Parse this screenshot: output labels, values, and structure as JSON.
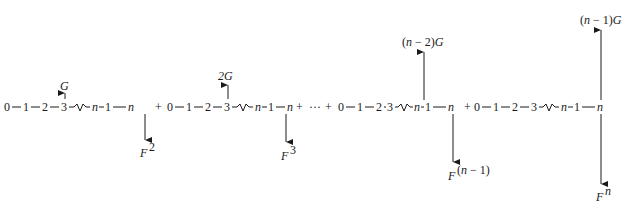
{
  "diagram": {
    "type": "sum of chain graphs with vertex loadings",
    "baseline_y": 107,
    "groups": [
      {
        "nodes": [
          "0",
          "1",
          "2",
          "3",
          "n",
          "n",
          "1",
          "n"
        ],
        "up_label": "G",
        "down_label": "F²",
        "operator_after": "+"
      },
      {
        "nodes": [
          "0",
          "1",
          "2",
          "3",
          "n",
          "1",
          "n"
        ],
        "up_label": "2G",
        "down_label": "F³",
        "operator_after": "+ ··· +"
      },
      {
        "nodes": [
          "0",
          "1",
          "2",
          "3",
          "n",
          "1",
          "n"
        ],
        "up_label": "(n − 2)G",
        "down_label": "F(n − 1)",
        "operator_after": "+"
      },
      {
        "nodes": [
          "0",
          "1",
          "2",
          "3",
          "n",
          "1",
          "n"
        ],
        "up_label": "(n − 1)G",
        "down_label": "Fn",
        "operator_after": ""
      }
    ],
    "labels": {
      "g1_up": "G",
      "g1_down_base": "F",
      "g1_down_sup": "2",
      "g2_up": "2G",
      "g2_down_base": "F",
      "g2_down_sup": "3",
      "g3_up": "(n − 2)G",
      "g3_down_base": "F",
      "g3_down_sup": "(n − 1)",
      "g4_up": "(n − 1)G",
      "g4_down_base": "F",
      "g4_down_sup": "n",
      "plus": "+",
      "dots": "···",
      "n": "n",
      "nminus": "n",
      "one": "1",
      "zero": "0",
      "two": "2",
      "three": "3"
    }
  }
}
